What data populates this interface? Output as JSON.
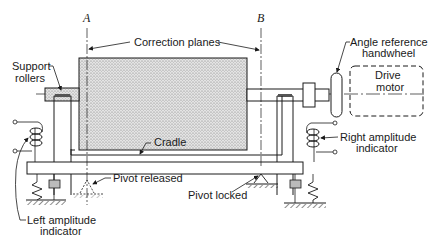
{
  "diagram": {
    "type": "mechanical-schematic",
    "plane_labels": {
      "a": "A",
      "b": "B"
    },
    "labels": {
      "correction_planes": "Correction planes",
      "support_rollers_line1": "Support",
      "support_rollers_line2": "rollers",
      "angle_reference_line1": "Angle reference",
      "angle_reference_line2": "handwheel",
      "drive_motor_line1": "Drive",
      "drive_motor_line2": "motor",
      "cradle": "Cradle",
      "right_amplitude_line1": "Right amplitude",
      "right_amplitude_line2": "indicator",
      "pivot_released": "Pivot released",
      "pivot_locked": "Pivot locked",
      "left_amplitude_line1": "Left amplitude",
      "left_amplitude_line2": "indicator"
    },
    "colors": {
      "line": "#1a1a1a",
      "rotor_fill": "#c8c8c8",
      "background": "#ffffff"
    }
  }
}
